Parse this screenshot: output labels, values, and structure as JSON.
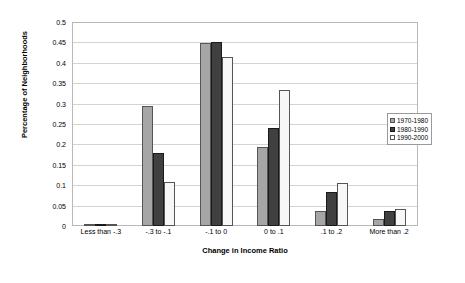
{
  "chart_data": {
    "type": "bar",
    "title": "",
    "xlabel": "Change in Income Ratio",
    "ylabel": "Percentage of Neighborhoods",
    "categories": [
      "Less than -.3",
      "-.3 to -.1",
      "-.1 to 0",
      "0 to .1",
      ".1 to .2",
      "More than .2"
    ],
    "series": [
      {
        "name": "1970-1980",
        "color": "#a6a6a6",
        "values": [
          0.002,
          0.295,
          0.449,
          0.193,
          0.038,
          0.017
        ]
      },
      {
        "name": "1980-1990",
        "color": "#404040",
        "values": [
          0.001,
          0.178,
          0.452,
          0.24,
          0.084,
          0.038
        ]
      },
      {
        "name": "1990-2000",
        "color": "#ffffff",
        "values": [
          0.0,
          0.107,
          0.414,
          0.334,
          0.106,
          0.042
        ]
      }
    ],
    "ylim": [
      0,
      0.5
    ],
    "yticks": [
      "0",
      "0.05",
      "0.1",
      "0.15",
      "0.2",
      "0.25",
      "0.3",
      "0.35",
      "0.4",
      "0.45",
      "0.5"
    ],
    "ytick_values": [
      0,
      0.05,
      0.1,
      0.15,
      0.2,
      0.25,
      0.3,
      0.35,
      0.4,
      0.45,
      0.5
    ],
    "grid": true,
    "legend_position": "right"
  }
}
